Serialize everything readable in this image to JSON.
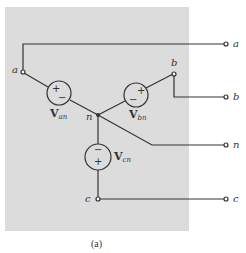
{
  "figure": {
    "caption": "(a)",
    "background_box_color": "#dcdcdc",
    "wire_color": "#333333"
  },
  "nodes": {
    "a_internal": "a",
    "b_internal": "b",
    "n_internal": "n",
    "c_internal": "c"
  },
  "terminals": [
    {
      "id": "a",
      "label": "a"
    },
    {
      "id": "b",
      "label": "b"
    },
    {
      "id": "n",
      "label": "n"
    },
    {
      "id": "c",
      "label": "c"
    }
  ],
  "sources": [
    {
      "id": "van",
      "main": "V",
      "sub": "an",
      "top_sign": "+",
      "bottom_sign": "−"
    },
    {
      "id": "vbn",
      "main": "V",
      "sub": "bn",
      "top_sign": "+",
      "bottom_sign": "−"
    },
    {
      "id": "vcn",
      "main": "V",
      "sub": "cn",
      "top_sign": "−",
      "bottom_sign": "+"
    }
  ]
}
